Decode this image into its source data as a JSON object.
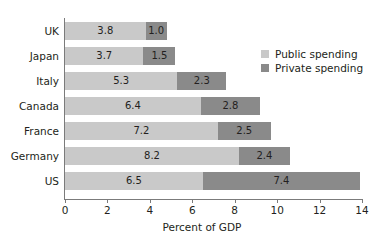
{
  "chart_data": {
    "type": "bar",
    "orientation": "horizontal",
    "stacked": true,
    "title": "",
    "xlabel": "Percent of GDP",
    "ylabel": "",
    "xlim": [
      0,
      14
    ],
    "xticks": [
      0,
      2,
      4,
      6,
      8,
      10,
      12,
      14
    ],
    "xtick_labels": [
      "0",
      "2",
      "4",
      "6",
      "8",
      "10",
      "12",
      "14"
    ],
    "grid": false,
    "legend_position": "upper right",
    "categories": [
      "UK",
      "Japan",
      "Italy",
      "Canada",
      "France",
      "Germany",
      "US"
    ],
    "series": [
      {
        "name": "Public spending",
        "color": "#c9c9c9",
        "values": [
          3.8,
          3.7,
          5.3,
          6.4,
          7.2,
          8.2,
          6.5
        ]
      },
      {
        "name": "Private spending",
        "color": "#8a8a8a",
        "values": [
          1.0,
          1.5,
          2.3,
          2.8,
          2.5,
          2.4,
          7.4
        ]
      }
    ],
    "rows": [
      {
        "category": "UK",
        "public": 3.8,
        "private": 1.0,
        "public_label": "3.8",
        "private_label": "1.0"
      },
      {
        "category": "Japan",
        "public": 3.7,
        "private": 1.5,
        "public_label": "3.7",
        "private_label": "1.5"
      },
      {
        "category": "Italy",
        "public": 5.3,
        "private": 2.3,
        "public_label": "5.3",
        "private_label": "2.3"
      },
      {
        "category": "Canada",
        "public": 6.4,
        "private": 2.8,
        "public_label": "6.4",
        "private_label": "2.8"
      },
      {
        "category": "France",
        "public": 7.2,
        "private": 2.5,
        "public_label": "7.2",
        "private_label": "2.5"
      },
      {
        "category": "Germany",
        "public": 8.2,
        "private": 2.4,
        "public_label": "8.2",
        "private_label": "2.4"
      },
      {
        "category": "US",
        "public": 6.5,
        "private": 7.4,
        "public_label": "6.5",
        "private_label": "7.4"
      }
    ],
    "legend": [
      {
        "label": "Public spending",
        "color": "#c9c9c9"
      },
      {
        "label": "Private spending",
        "color": "#8a8a8a"
      }
    ]
  }
}
